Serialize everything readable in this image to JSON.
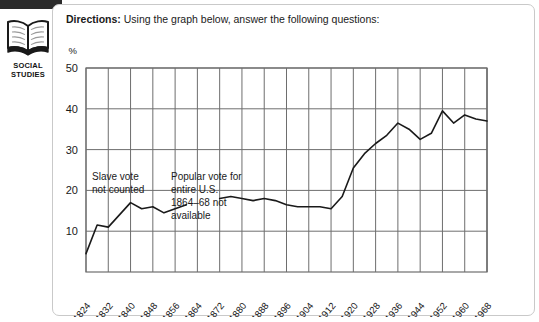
{
  "page": {
    "subject_badge": {
      "icon": "open-book-icon",
      "label": "SOCIAL\nSTUDIES"
    },
    "directions": {
      "label": "Directions:",
      "text": " Using the graph below, answer the following questions:"
    }
  },
  "chart_data": {
    "type": "line",
    "title": "",
    "xlabel": "",
    "ylabel": "%",
    "ylim": [
      0,
      50
    ],
    "yticks": [
      10,
      20,
      30,
      40,
      50
    ],
    "grid": true,
    "legend": "none",
    "categories": [
      "1824",
      "1828",
      "1832",
      "1836",
      "1840",
      "1844",
      "1848",
      "1852",
      "1856",
      "1860",
      "1864",
      "1868",
      "1872",
      "1876",
      "1880",
      "1884",
      "1888",
      "1892",
      "1896",
      "1900",
      "1904",
      "1908",
      "1912",
      "1916",
      "1920",
      "1924",
      "1928",
      "1932",
      "1936",
      "1940",
      "1944",
      "1948",
      "1952",
      "1956",
      "1960",
      "1964",
      "1968"
    ],
    "tick_labels": [
      "1824",
      "1832",
      "1840",
      "1848",
      "1856",
      "1864",
      "1872",
      "1880",
      "1888",
      "1896",
      "1904",
      "1912",
      "1920",
      "1928",
      "1936",
      "1944",
      "1952",
      "1960",
      "1968"
    ],
    "values": [
      4.5,
      11.5,
      11.0,
      14.0,
      17.0,
      15.5,
      16.0,
      14.5,
      15.5,
      16.5,
      null,
      null,
      18.0,
      18.5,
      18.0,
      17.5,
      18.0,
      17.5,
      16.5,
      16.0,
      16.0,
      16.0,
      15.5,
      18.5,
      25.5,
      29.0,
      31.5,
      33.5,
      36.5,
      35.0,
      32.5,
      34.0,
      39.5,
      36.5,
      38.5,
      37.5,
      37.0
    ],
    "annotations": [
      {
        "name": "slave-vote-note",
        "text": "Slave vote\nnot counted"
      },
      {
        "name": "popular-vote-note",
        "text": "Popular vote for\nentire U.S.\n1864–68 not\navailable"
      }
    ],
    "colors": {
      "line": "#1a1a1a",
      "grid": "#6e6e6e",
      "axis": "#6e6e6e"
    }
  }
}
